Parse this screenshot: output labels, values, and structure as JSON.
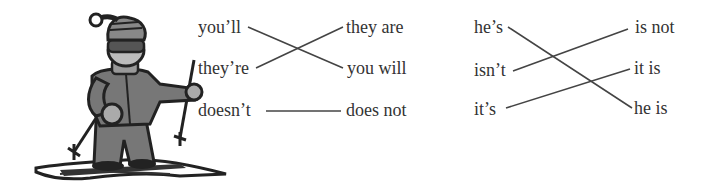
{
  "exercise": {
    "groups": [
      {
        "left": [
          "you’ll",
          "they’re",
          "doesn’t"
        ],
        "right": [
          "they are",
          "you will",
          "does not"
        ],
        "matches": [
          {
            "from": "you’ll",
            "to": "you will"
          },
          {
            "from": "they’re",
            "to": "they are"
          },
          {
            "from": "doesn’t",
            "to": "does not"
          }
        ]
      },
      {
        "left": [
          "he’s",
          "isn’t",
          "it’s"
        ],
        "right": [
          "is not",
          "it is",
          "he is"
        ],
        "matches": [
          {
            "from": "he’s",
            "to": "he is"
          },
          {
            "from": "isn’t",
            "to": "is not"
          },
          {
            "from": "it’s",
            "to": "it is"
          }
        ]
      }
    ]
  },
  "illustration": {
    "subject": "cartoon skier with ski poles, striped hat and goggles",
    "icon": "skier-icon"
  },
  "colors": {
    "text": "#333333",
    "line": "#444444",
    "background": "#ffffff"
  }
}
